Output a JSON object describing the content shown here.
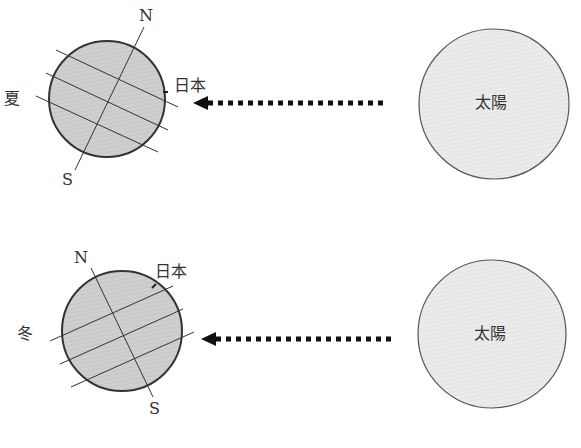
{
  "summer": {
    "season_label": "夏",
    "north_label": "N",
    "south_label": "S",
    "japan_label": "日本",
    "sun_label": "太陽"
  },
  "winter": {
    "season_label": "冬",
    "north_label": "N",
    "south_label": "S",
    "japan_label": "日本",
    "sun_label": "太陽"
  },
  "colors": {
    "earth_fill": "#c9c9c9",
    "sun_fill": "#e6e6e6",
    "stroke": "#333333"
  }
}
